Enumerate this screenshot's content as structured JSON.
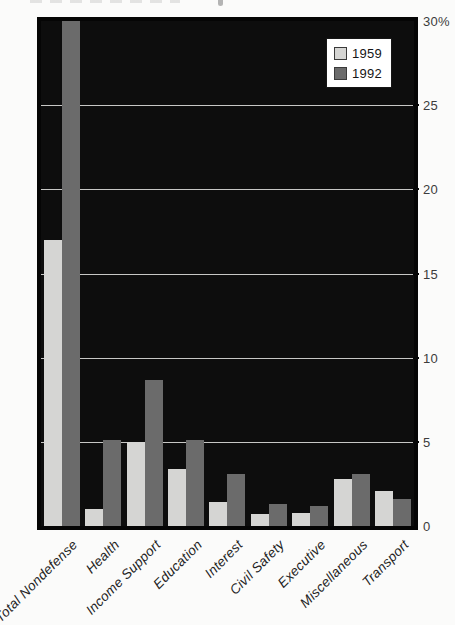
{
  "legend": {
    "items": [
      {
        "label": "1959"
      },
      {
        "label": "1992"
      }
    ]
  },
  "y_axis": {
    "ticks": [
      {
        "value": 30,
        "label": "30%"
      },
      {
        "value": 25,
        "label": "25"
      },
      {
        "value": 20,
        "label": "20"
      },
      {
        "value": 15,
        "label": "15"
      },
      {
        "value": 10,
        "label": "10"
      },
      {
        "value": 5,
        "label": "5"
      },
      {
        "value": 0,
        "label": "0"
      }
    ]
  },
  "chart_data": {
    "type": "bar",
    "title": "",
    "categories": [
      "Total Nondefense",
      "Health",
      "Income Support",
      "Education",
      "Interest",
      "Civil Safety",
      "Executive",
      "Miscellaneous",
      "Transport"
    ],
    "series": [
      {
        "name": "1959",
        "color": "#d5d5d3",
        "values": [
          17.0,
          1.0,
          5.0,
          3.4,
          1.4,
          0.7,
          0.8,
          2.8,
          2.1
        ]
      },
      {
        "name": "1992",
        "color": "#6b6b6b",
        "values": [
          30.0,
          5.1,
          8.7,
          5.1,
          3.1,
          1.3,
          1.2,
          3.1,
          1.6
        ]
      }
    ],
    "ylim": [
      0,
      30
    ],
    "y_unit": "%",
    "grid": true,
    "gridline_values": [
      5,
      10,
      15,
      20,
      25
    ],
    "legend_position": "top-right",
    "plot_background": "#0d0d0d",
    "annotations": "1992 Total Nondefense bar is clipped at the 30% top edge of the plot"
  }
}
